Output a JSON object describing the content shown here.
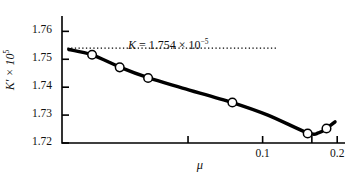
{
  "chart_data": {
    "type": "scatter",
    "title": "",
    "xlabel": "μ",
    "ylabel": "K′ × 10⁵",
    "x_scale": "log",
    "xlim": [
      0.0155,
      0.215
    ],
    "ylim": [
      1.72,
      1.7655
    ],
    "grid": false,
    "legend": null,
    "x_ticks": [
      {
        "value": 0.05,
        "label": ""
      },
      {
        "value": 0.1,
        "label": "0.1"
      },
      {
        "value": 0.158,
        "label": ""
      },
      {
        "value": 0.2,
        "label": "0.2"
      }
    ],
    "y_ticks": [
      {
        "value": 1.76,
        "label": "1.76"
      },
      {
        "value": 1.75,
        "label": "1.75"
      },
      {
        "value": 1.74,
        "label": "1.74"
      },
      {
        "value": 1.73,
        "label": "1.73"
      },
      {
        "value": 1.72,
        "label": "1.72"
      }
    ],
    "series": [
      {
        "name": "measured K′",
        "marker": "open-circle",
        "x": [
          0.0205,
          0.0265,
          0.0345,
          0.0755,
          0.152,
          0.181
        ],
        "y": [
          1.7516,
          1.7471,
          1.7433,
          1.7345,
          1.7234,
          1.7252
        ]
      }
    ],
    "fit_curve": {
      "name": "smooth fit through data",
      "x": [
        0.0165,
        0.0205,
        0.0265,
        0.0345,
        0.0475,
        0.0755,
        0.105,
        0.152,
        0.168,
        0.181,
        0.196
      ],
      "y": [
        1.7535,
        1.7516,
        1.7472,
        1.7434,
        1.7397,
        1.7345,
        1.73,
        1.7236,
        1.7236,
        1.7252,
        1.7276
      ]
    },
    "annotations": [
      {
        "name": "extrapolated-intercept",
        "text": "K = 1.754 × 10⁻⁵",
        "symbol": "K",
        "equals": "=",
        "value": "1.754",
        "times": "×",
        "base": "10",
        "exponent": "−5",
        "y_value": 1.754,
        "line_style": "dotted",
        "line_from_x": 0.0163,
        "line_to_x": 0.0615
      }
    ]
  },
  "axis_labels": {
    "x_title": "μ",
    "y_title_symbol": "K′",
    "y_title_times": "×",
    "y_title_base": "10",
    "y_title_exponent": "5"
  },
  "colors": {
    "axis": "#000000",
    "curve": "#000000",
    "marker_edge": "#000000",
    "marker_fill": "#ffffff",
    "dotted_line": "#000000",
    "background": "#ffffff"
  }
}
